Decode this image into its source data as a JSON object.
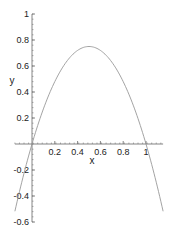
{
  "chart_data": {
    "type": "line",
    "title": "",
    "xlabel": "x",
    "ylabel": "y",
    "xlim": [
      -0.15,
      1.15
    ],
    "ylim": [
      -0.6,
      1
    ],
    "grid": false,
    "legend": null,
    "x_ticks": [
      "0.2",
      "0.4",
      "0.6",
      "0.8",
      "1"
    ],
    "y_ticks": [
      "1",
      "0.8",
      "0.6",
      "0.4",
      "0.2",
      "-0.2",
      "-0.4",
      "-0.6"
    ],
    "series": [
      {
        "name": "y = 3x(1-x)",
        "color": "#999999",
        "x": [
          -0.15,
          -0.1,
          0,
          0.1,
          0.2,
          0.3,
          0.4,
          0.5,
          0.6,
          0.7,
          0.8,
          0.9,
          1.0,
          1.1,
          1.15
        ],
        "y": [
          -0.52,
          -0.33,
          0,
          0.27,
          0.48,
          0.63,
          0.72,
          0.75,
          0.72,
          0.63,
          0.48,
          0.27,
          0,
          -0.33,
          -0.52
        ]
      }
    ]
  },
  "colors": {
    "axis": "#666666",
    "curve": "#999999"
  }
}
